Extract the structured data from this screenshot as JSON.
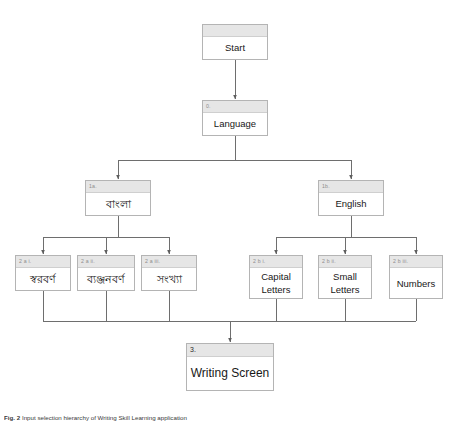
{
  "figure": {
    "caption_label": "Fig. 2",
    "caption_text": "Input selection hierarchy of Writing Skill Learning application",
    "background_color": "#ffffff",
    "box_header_color": "#e6e6e6",
    "box_border_color": "#b4b4b4",
    "line_color": "#6e6e6e"
  },
  "nodes": {
    "start": {
      "tag": "",
      "label": "Start"
    },
    "language": {
      "tag": "0.",
      "label": "Language"
    },
    "bangla": {
      "tag": "1a.",
      "label": "বাংলা"
    },
    "english": {
      "tag": "1b.",
      "label": "English"
    },
    "swarabarna": {
      "tag": "2 a i.",
      "label": "স্বরবর্ণ"
    },
    "byanjan": {
      "tag": "2 a ii.",
      "label": "ব্যঞ্জনবর্ণ"
    },
    "sankhya": {
      "tag": "2 a iii.",
      "label": "সংখ্যা"
    },
    "capital": {
      "tag": "2 b i.",
      "label": "Capital Letters"
    },
    "small": {
      "tag": "2 b ii.",
      "label": "Small Letters"
    },
    "numbers": {
      "tag": "2 b iii.",
      "label": "Numbers"
    },
    "writing": {
      "tag": "3.",
      "label": "Writing Screen"
    }
  }
}
